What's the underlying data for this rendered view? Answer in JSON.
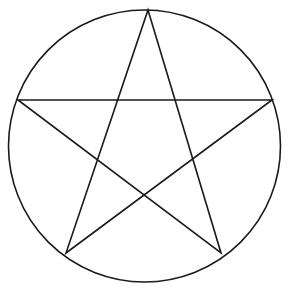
{
  "canvas": {
    "width": 290,
    "height": 296,
    "background_color": "#ffffff",
    "stroke_color": "#1a1a1a",
    "stroke_width": 1.6,
    "title": "Pentagram"
  },
  "figure": {
    "name": "pentagram",
    "circle": {
      "name": "circumscribed-circle",
      "center_x": 144.5,
      "center_y": 146,
      "radius": 136,
      "fill": "none",
      "stroke_color": "#1a1a1a",
      "stroke_width": 1.6
    },
    "star": {
      "name": "pentagram-star",
      "point_count": 5,
      "schlafli": "{5/2}",
      "closed": true,
      "fill": "none",
      "stroke_color": "#1a1a1a",
      "stroke_width": 1.6,
      "vertices": [
        {
          "label": "top",
          "x": 148,
          "y": 10
        },
        {
          "label": "bottom-right",
          "x": 221,
          "y": 253
        },
        {
          "label": "left",
          "x": 18,
          "y": 100
        },
        {
          "label": "right",
          "x": 272,
          "y": 100
        },
        {
          "label": "bottom-left",
          "x": 66,
          "y": 253
        }
      ],
      "path_points": "148,10 221,253 18,100 272,100 66,253",
      "inner_intersections": [
        {
          "label": "inner-top-left",
          "x": 114,
          "y": 100
        },
        {
          "label": "inner-top-right",
          "x": 178,
          "y": 100
        },
        {
          "label": "inner-left",
          "x": 104,
          "y": 162
        },
        {
          "label": "inner-right",
          "x": 189,
          "y": 162
        },
        {
          "label": "inner-bottom",
          "x": 144,
          "y": 192
        }
      ]
    }
  }
}
